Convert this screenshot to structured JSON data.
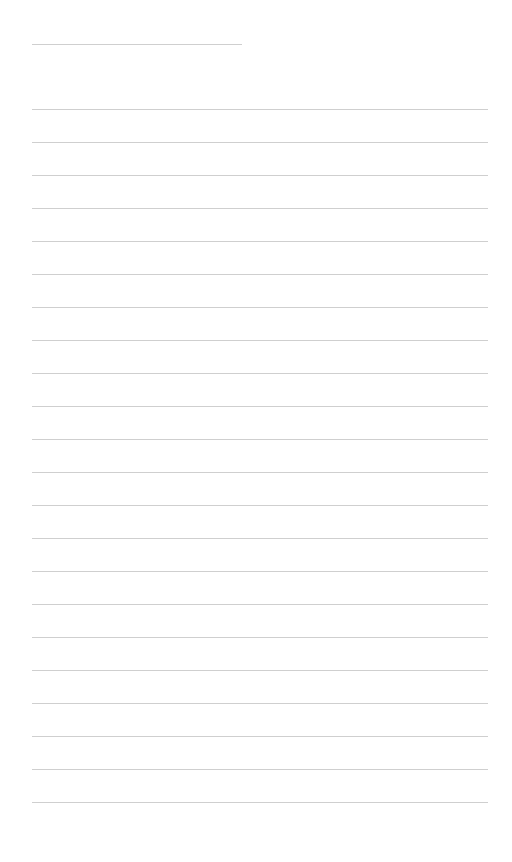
{
  "document": {
    "type": "blank lined sheet",
    "title_line": {
      "left": 32,
      "top": 44,
      "width": 210,
      "text": ""
    },
    "rules": {
      "count": 22,
      "first_top": 109,
      "spacing": 33,
      "left": 32,
      "width": 456,
      "color": "#cfcfcf",
      "lines_text": [
        "",
        "",
        "",
        "",
        "",
        "",
        "",
        "",
        "",
        "",
        "",
        "",
        "",
        "",
        "",
        "",
        "",
        "",
        "",
        "",
        "",
        ""
      ]
    },
    "background": "#ffffff"
  }
}
